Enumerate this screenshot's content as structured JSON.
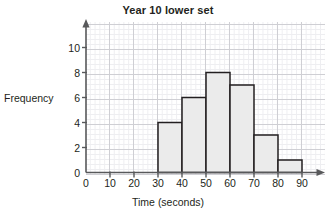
{
  "chart_data": {
    "type": "bar",
    "title": "Year 10 lower set",
    "xlabel": "Time (seconds)",
    "ylabel": "Frequency",
    "xlim": [
      0,
      95
    ],
    "ylim": [
      0,
      11.5
    ],
    "grid": true,
    "legend": false,
    "bin_width": 10,
    "categories": [
      "30-40",
      "40-50",
      "50-60",
      "60-70",
      "70-80",
      "80-90"
    ],
    "bin_edges": [
      30,
      40,
      50,
      60,
      70,
      80,
      90
    ],
    "values": [
      4,
      6,
      8,
      7,
      3,
      1
    ],
    "x_ticks": [
      0,
      10,
      20,
      30,
      40,
      50,
      60,
      70,
      80,
      90
    ],
    "x_tick_labels": [
      "0",
      "10",
      "20",
      "30",
      "40",
      "50",
      "60",
      "70",
      "80",
      "90"
    ],
    "y_ticks": [
      0,
      2,
      4,
      6,
      8,
      10
    ],
    "y_tick_labels": [
      "0",
      "2",
      "4",
      "6",
      "8",
      "10"
    ],
    "colors": {
      "bar_fill": "#ebebeb",
      "bar_stroke": "#231f20",
      "axis": "#58595b",
      "grid_minor": "#eeeef1",
      "grid_major": "#cfcfd4",
      "text": "#231f20",
      "background": "#ffffff"
    }
  }
}
